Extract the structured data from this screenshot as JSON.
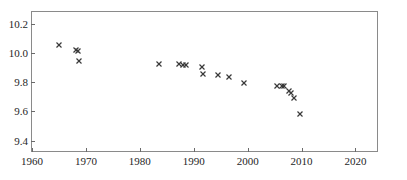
{
  "chart_data": {
    "type": "scatter",
    "title": "",
    "subtitle": "",
    "xlabel": "",
    "ylabel": "",
    "xlim": [
      1960,
      2024
    ],
    "ylim": [
      9.33,
      10.28
    ],
    "grid": false,
    "legend": null,
    "marker": "x",
    "marker_color": "#3a3a3a",
    "xticks": [
      1960,
      1970,
      1980,
      1990,
      2000,
      2010,
      2020
    ],
    "xtick_labels": [
      "1960",
      "1970",
      "1980",
      "1990",
      "2000",
      "2010",
      "2020"
    ],
    "yticks": [
      9.4,
      9.6,
      9.8,
      10.0,
      10.2
    ],
    "ytick_labels": [
      "9.4",
      "9.6",
      "9.8",
      "10.0",
      "10.2"
    ],
    "series": [
      {
        "name": "observations",
        "points": [
          {
            "x": 1964.8,
            "y": 10.06
          },
          {
            "x": 1967.9,
            "y": 10.03
          },
          {
            "x": 1968.3,
            "y": 10.02
          },
          {
            "x": 1968.5,
            "y": 9.95
          },
          {
            "x": 1983.4,
            "y": 9.93
          },
          {
            "x": 1987.0,
            "y": 9.93
          },
          {
            "x": 1987.9,
            "y": 9.928
          },
          {
            "x": 1988.3,
            "y": 9.928
          },
          {
            "x": 1991.4,
            "y": 9.908
          },
          {
            "x": 1991.5,
            "y": 9.862
          },
          {
            "x": 1994.4,
            "y": 9.855
          },
          {
            "x": 1996.4,
            "y": 9.845
          },
          {
            "x": 1999.2,
            "y": 9.8
          },
          {
            "x": 2005.3,
            "y": 9.778
          },
          {
            "x": 2006.2,
            "y": 9.782
          },
          {
            "x": 2006.6,
            "y": 9.782
          },
          {
            "x": 2007.5,
            "y": 9.748
          },
          {
            "x": 2007.9,
            "y": 9.735
          },
          {
            "x": 2008.5,
            "y": 9.7
          },
          {
            "x": 2009.6,
            "y": 9.588
          }
        ]
      }
    ]
  },
  "axes": {
    "frame_color": "#8a8a8a",
    "tick_color": "#6a6a6a",
    "label_color": "#262626",
    "background": "#ffffff"
  }
}
